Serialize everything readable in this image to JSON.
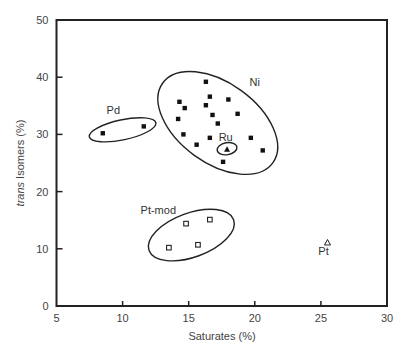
{
  "chart_data": {
    "type": "scatter",
    "title": "",
    "xlabel": "Saturates (%)",
    "ylabel_italic": "trans",
    "ylabel_rest": " Isomers (%)",
    "ylabel": "trans Isomers (%)",
    "xlim": [
      5,
      30
    ],
    "ylim": [
      0,
      50
    ],
    "xticks": [
      5,
      10,
      15,
      20,
      25,
      30
    ],
    "yticks": [
      0,
      10,
      20,
      30,
      40,
      50
    ],
    "grid": false,
    "legend": "none (groups labelled inline)",
    "series": [
      {
        "name": "Ni",
        "marker": "filled-square",
        "points": [
          [
            16.3,
            39.2
          ],
          [
            16.6,
            36.6
          ],
          [
            18.0,
            36.1
          ],
          [
            14.3,
            35.7
          ],
          [
            16.3,
            35.1
          ],
          [
            14.7,
            34.6
          ],
          [
            18.7,
            33.6
          ],
          [
            16.8,
            33.4
          ],
          [
            14.2,
            32.7
          ],
          [
            17.2,
            31.9
          ],
          [
            14.6,
            30.0
          ],
          [
            16.6,
            29.4
          ],
          [
            19.7,
            29.4
          ],
          [
            15.6,
            28.2
          ],
          [
            20.6,
            27.2
          ],
          [
            17.6,
            25.2
          ]
        ]
      },
      {
        "name": "Ru",
        "marker": "filled-triangle",
        "points": [
          [
            17.9,
            27.4
          ]
        ]
      },
      {
        "name": "Pd",
        "marker": "filled-square",
        "points": [
          [
            8.5,
            30.2
          ],
          [
            11.6,
            31.4
          ]
        ]
      },
      {
        "name": "Pt-mod",
        "marker": "open-square",
        "points": [
          [
            14.8,
            14.4
          ],
          [
            16.6,
            15.1
          ],
          [
            13.5,
            10.2
          ],
          [
            15.7,
            10.7
          ]
        ]
      },
      {
        "name": "Pt",
        "marker": "open-triangle",
        "points": [
          [
            25.5,
            11.1
          ]
        ]
      }
    ],
    "annotations": [
      {
        "text": "Ni",
        "x": 20.0,
        "y": 38.5
      },
      {
        "text": "Ru",
        "x": 17.8,
        "y": 28.8
      },
      {
        "text": "Pd",
        "x": 9.3,
        "y": 33.5
      },
      {
        "text": "Pt-mod",
        "x": 12.7,
        "y": 16.0
      },
      {
        "text": "Pt",
        "x": 25.2,
        "y": 9.0
      }
    ],
    "enclosures": [
      {
        "group": "Ni",
        "cx": 17.2,
        "cy": 32.0,
        "rx": 68,
        "ry": 40,
        "rotate": 36
      },
      {
        "group": "Ru",
        "cx": 17.9,
        "cy": 27.5,
        "rx": 10,
        "ry": 6,
        "rotate": -10
      },
      {
        "group": "Pd",
        "cx": 10.0,
        "cy": 30.8,
        "rx": 34,
        "ry": 10,
        "rotate": -12
      },
      {
        "group": "Pt-mod",
        "cx": 15.2,
        "cy": 12.4,
        "rx": 45,
        "ry": 22,
        "rotate": -20
      }
    ]
  }
}
